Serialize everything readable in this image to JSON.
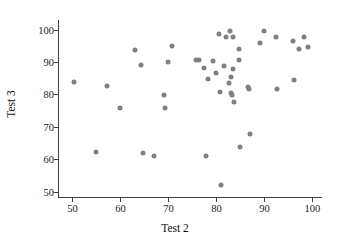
{
  "chart_data": {
    "type": "scatter",
    "title": "",
    "xlabel": "Test 2",
    "ylabel": "Test 3",
    "xlim": [
      47,
      102
    ],
    "ylim": [
      48,
      103
    ],
    "xticks": [
      50,
      60,
      70,
      80,
      90,
      100
    ],
    "yticks": [
      50,
      60,
      70,
      80,
      90,
      100
    ],
    "grid": false,
    "legend": null,
    "marker": {
      "shape": "circle",
      "color": "#7f7f85",
      "size": 5
    },
    "points": [
      {
        "x": 50.3,
        "y": 83.7
      },
      {
        "x": 55.0,
        "y": 62.2
      },
      {
        "x": 57.3,
        "y": 82.6
      },
      {
        "x": 60.0,
        "y": 75.7
      },
      {
        "x": 63.0,
        "y": 93.8
      },
      {
        "x": 64.3,
        "y": 89.0
      },
      {
        "x": 64.8,
        "y": 62.0
      },
      {
        "x": 66.9,
        "y": 61.1
      },
      {
        "x": 69.1,
        "y": 79.9
      },
      {
        "x": 69.3,
        "y": 75.7
      },
      {
        "x": 70.0,
        "y": 89.9
      },
      {
        "x": 70.7,
        "y": 94.9
      },
      {
        "x": 75.8,
        "y": 90.6
      },
      {
        "x": 76.4,
        "y": 90.7
      },
      {
        "x": 77.4,
        "y": 88.3
      },
      {
        "x": 77.9,
        "y": 61.0
      },
      {
        "x": 78.3,
        "y": 84.7
      },
      {
        "x": 79.2,
        "y": 90.4
      },
      {
        "x": 80.0,
        "y": 86.7
      },
      {
        "x": 80.5,
        "y": 98.6
      },
      {
        "x": 80.7,
        "y": 80.9
      },
      {
        "x": 80.9,
        "y": 52.1
      },
      {
        "x": 81.6,
        "y": 88.8
      },
      {
        "x": 82.1,
        "y": 97.7
      },
      {
        "x": 82.6,
        "y": 83.5
      },
      {
        "x": 82.8,
        "y": 99.7
      },
      {
        "x": 83.0,
        "y": 80.3
      },
      {
        "x": 83.1,
        "y": 85.3
      },
      {
        "x": 83.3,
        "y": 79.9
      },
      {
        "x": 83.4,
        "y": 87.8
      },
      {
        "x": 83.5,
        "y": 97.8
      },
      {
        "x": 83.6,
        "y": 77.7
      },
      {
        "x": 84.7,
        "y": 90.6
      },
      {
        "x": 84.8,
        "y": 93.9
      },
      {
        "x": 85.0,
        "y": 63.9
      },
      {
        "x": 86.6,
        "y": 82.3
      },
      {
        "x": 86.7,
        "y": 81.6
      },
      {
        "x": 87.0,
        "y": 67.9
      },
      {
        "x": 89.0,
        "y": 95.8
      },
      {
        "x": 90.0,
        "y": 99.6
      },
      {
        "x": 92.4,
        "y": 97.8
      },
      {
        "x": 92.6,
        "y": 81.6
      },
      {
        "x": 95.9,
        "y": 96.6
      },
      {
        "x": 96.1,
        "y": 84.6
      },
      {
        "x": 97.3,
        "y": 93.9
      },
      {
        "x": 98.2,
        "y": 97.6
      },
      {
        "x": 99.0,
        "y": 94.8
      }
    ]
  }
}
